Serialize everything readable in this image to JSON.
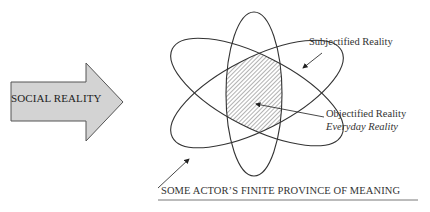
{
  "arrow": {
    "label": "SOCIAL REALITY",
    "fill": "#d3d3d3",
    "stroke": "#555555"
  },
  "labels": {
    "subjectified": "Subjectified Reality",
    "objectified": "Objectified Reality",
    "everyday": "Everyday Reality",
    "caption": "SOME ACTOR’S FINITE PROVINCE OF MEANING"
  },
  "colors": {
    "line": "#333333",
    "hatch": "#555555",
    "background": "#ffffff"
  }
}
